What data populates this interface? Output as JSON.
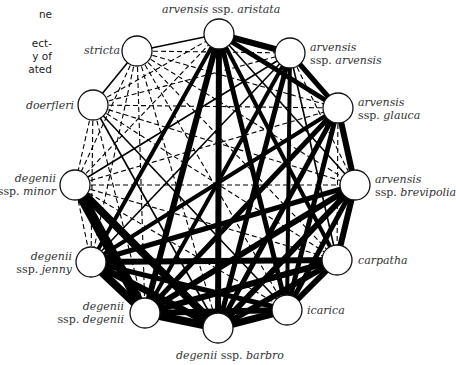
{
  "caption_fragments": [
    "ne",
    "ect-",
    "y of",
    "ated"
  ],
  "nodes": [
    {
      "id": "aristata",
      "x": 219,
      "y": 34,
      "label_italic1": "arvensis",
      "label_plain": " ssp. ",
      "label_italic2": "aristata"
    },
    {
      "id": "arvensis",
      "x": 290,
      "y": 53,
      "line1": "arvensis",
      "line2_plain": "ssp. ",
      "line2_italic": "arvensis"
    },
    {
      "id": "glauca",
      "x": 338,
      "y": 108,
      "line1": "arvensis",
      "line2_plain": "ssp. ",
      "line2_italic": "glauca"
    },
    {
      "id": "brevipolia",
      "x": 355,
      "y": 185,
      "line1": "arvensis",
      "line2_plain": "ssp. ",
      "line2_italic": "brevipolia"
    },
    {
      "id": "carpatha",
      "x": 337,
      "y": 260,
      "line1": "carpatha"
    },
    {
      "id": "icarica",
      "x": 287,
      "y": 310,
      "line1": "icarica"
    },
    {
      "id": "barbro",
      "x": 218,
      "y": 328,
      "label_italic1": "degenii",
      "label_plain": " ssp. ",
      "label_italic2": "barbro"
    },
    {
      "id": "degenii",
      "x": 145,
      "y": 313,
      "line1": "degenii",
      "line2_plain": "ssp. ",
      "line2_italic": "degenii"
    },
    {
      "id": "jenny",
      "x": 91,
      "y": 262,
      "line1": "degenii",
      "line2_plain": "ssp. ",
      "line2_italic": "jenny"
    },
    {
      "id": "minor",
      "x": 75,
      "y": 185,
      "line1": "degenii",
      "line2_plain": "ssp. ",
      "line2_italic": "minor"
    },
    {
      "id": "doerfleri",
      "x": 93,
      "y": 105,
      "line1": "doerfleri"
    },
    {
      "id": "stricta",
      "x": 137,
      "y": 51,
      "line1": "stricta"
    }
  ],
  "edges": {
    "thick": [
      [
        "aristata",
        "arvensis",
        6
      ],
      [
        "aristata",
        "glauca",
        5
      ],
      [
        "aristata",
        "barbro",
        6
      ],
      [
        "aristata",
        "degenii",
        6
      ],
      [
        "aristata",
        "icarica",
        5
      ],
      [
        "aristata",
        "carpatha",
        4
      ],
      [
        "aristata",
        "jenny",
        4
      ],
      [
        "arvensis",
        "glauca",
        5
      ],
      [
        "arvensis",
        "barbro",
        5
      ],
      [
        "arvensis",
        "degenii",
        4
      ],
      [
        "arvensis",
        "icarica",
        4
      ],
      [
        "glauca",
        "brevipolia",
        6
      ],
      [
        "glauca",
        "barbro",
        5
      ],
      [
        "glauca",
        "degenii",
        5
      ],
      [
        "glauca",
        "jenny",
        4
      ],
      [
        "glauca",
        "icarica",
        5
      ],
      [
        "brevipolia",
        "carpatha",
        6
      ],
      [
        "brevipolia",
        "degenii",
        6
      ],
      [
        "brevipolia",
        "jenny",
        5
      ],
      [
        "brevipolia",
        "barbro",
        6
      ],
      [
        "brevipolia",
        "icarica",
        5
      ],
      [
        "carpatha",
        "icarica",
        6
      ],
      [
        "carpatha",
        "degenii",
        6
      ],
      [
        "carpatha",
        "jenny",
        6
      ],
      [
        "carpatha",
        "barbro",
        6
      ],
      [
        "icarica",
        "barbro",
        7
      ],
      [
        "icarica",
        "degenii",
        6
      ],
      [
        "icarica",
        "jenny",
        5
      ],
      [
        "barbro",
        "degenii",
        8
      ],
      [
        "barbro",
        "jenny",
        7
      ],
      [
        "degenii",
        "jenny",
        8
      ],
      [
        "minor",
        "degenii",
        10
      ],
      [
        "minor",
        "barbro",
        8
      ]
    ],
    "thin": [
      [
        "stricta",
        "doerfleri"
      ],
      [
        "stricta",
        "aristata"
      ],
      [
        "doerfleri",
        "barbro"
      ],
      [
        "doerfleri",
        "icarica"
      ],
      [
        "arvensis",
        "carpatha"
      ],
      [
        "aristata",
        "brevipolia"
      ],
      [
        "minor",
        "arvensis"
      ],
      [
        "jenny",
        "arvensis"
      ],
      [
        "degenii",
        "minor"
      ]
    ],
    "dashed": [
      [
        "stricta",
        "arvensis"
      ],
      [
        "stricta",
        "glauca"
      ],
      [
        "stricta",
        "brevipolia"
      ],
      [
        "stricta",
        "carpatha"
      ],
      [
        "stricta",
        "icarica"
      ],
      [
        "stricta",
        "barbro"
      ],
      [
        "stricta",
        "degenii"
      ],
      [
        "stricta",
        "jenny"
      ],
      [
        "stricta",
        "minor"
      ],
      [
        "doerfleri",
        "aristata"
      ],
      [
        "doerfleri",
        "arvensis"
      ],
      [
        "doerfleri",
        "glauca"
      ],
      [
        "doerfleri",
        "brevipolia"
      ],
      [
        "doerfleri",
        "carpatha"
      ],
      [
        "doerfleri",
        "degenii"
      ],
      [
        "doerfleri",
        "jenny"
      ],
      [
        "doerfleri",
        "minor"
      ],
      [
        "minor",
        "aristata"
      ],
      [
        "minor",
        "glauca"
      ],
      [
        "minor",
        "brevipolia"
      ],
      [
        "minor",
        "carpatha"
      ],
      [
        "minor",
        "icarica"
      ],
      [
        "minor",
        "jenny"
      ],
      [
        "arvensis",
        "brevipolia"
      ],
      [
        "glauca",
        "carpatha"
      ]
    ]
  },
  "colors": {
    "edge": "#000000",
    "node_fill": "#ffffff",
    "node_stroke": "#111111",
    "text": "#333333"
  }
}
